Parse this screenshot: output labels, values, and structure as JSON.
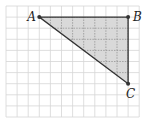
{
  "figure": {
    "type": "triangle-on-grid",
    "grid": {
      "origin_x": 6,
      "origin_y": 6,
      "cell_size": 11.1,
      "columns": 12,
      "rows": 10,
      "line_color": "#d6d6d6"
    },
    "triangle": {
      "fill_color": "#d9d9d9",
      "stroke_color": "#333333",
      "interior_grid_color": "#8a8a8a",
      "vertices": [
        {
          "name": "A",
          "label": "A",
          "grid_x": 3,
          "grid_y": 1
        },
        {
          "name": "B",
          "label": "B",
          "grid_x": 11,
          "grid_y": 1
        },
        {
          "name": "C",
          "label": "C",
          "grid_x": 11,
          "grid_y": 7
        }
      ],
      "right_angle_at": "B"
    }
  }
}
